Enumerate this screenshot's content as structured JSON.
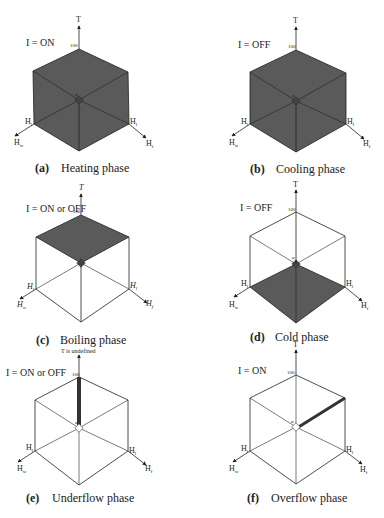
{
  "figure": {
    "panels": [
      {
        "id": "a",
        "letter": "(a)",
        "caption": "Heating phase",
        "condition": "I = ON",
        "axis_top": "T",
        "tick_max": "100",
        "origin": "α",
        "axis_left": "H_w",
        "axis_right": "H_f",
        "corner_left": "H_l",
        "corner_right": "H_l",
        "shaded_region": "entire cube",
        "cx": 79,
        "cy": 100
      },
      {
        "id": "b",
        "letter": "(b)",
        "caption": "Cooling phase",
        "condition": "I = OFF",
        "axis_top": "T",
        "tick_max": "100",
        "origin": "α",
        "axis_left": "H_w",
        "axis_right": "H_f",
        "corner_left": "H_l",
        "corner_right": "H_l",
        "shaded_region": "entire cube",
        "cx": 296,
        "cy": 101
      },
      {
        "id": "c",
        "letter": "(c)",
        "caption": "Boiling phase",
        "condition": "I = ON or OFF",
        "axis_top": "T",
        "tick_max": "100",
        "origin": "α",
        "axis_left": "H_w",
        "axis_right": "H_f",
        "corner_left": "H_l",
        "corner_right": "H_l",
        "shaded_region": "top face (T = 100)",
        "cx": 81,
        "cy": 265
      },
      {
        "id": "d",
        "letter": "(d)",
        "caption": "Cold phase",
        "condition": "I = OFF",
        "axis_top": "T",
        "tick_max": "100",
        "origin": "α",
        "axis_left": "H_w",
        "axis_right": "H_f",
        "corner_left": "H_l",
        "corner_right": "H_l",
        "shaded_region": "bottom face",
        "cx": 296,
        "cy": 264
      },
      {
        "id": "e",
        "letter": "(e)",
        "caption": "Underflow phase",
        "condition": "I = ON or OFF",
        "axis_top": "T is undefined",
        "tick_max": "100",
        "origin": "α",
        "axis_left": "H_w",
        "axis_right": "H_f",
        "corner_left": "H_l",
        "corner_right": "H_l",
        "shaded_region": "T axis edge",
        "cx": 79,
        "cy": 428
      },
      {
        "id": "f",
        "letter": "(f)",
        "caption": "Overflow phase",
        "condition": "I = ON",
        "axis_top": "T",
        "tick_max": "100",
        "origin": "α",
        "axis_left": "H_w",
        "axis_right": "H_f",
        "corner_left": "H_l",
        "corner_right": "H_l",
        "shaded_region": "H_f axis edge",
        "cx": 296,
        "cy": 427
      }
    ],
    "colors": {
      "shade": "#595959",
      "line": "#222222",
      "background": "#ffffff"
    }
  }
}
